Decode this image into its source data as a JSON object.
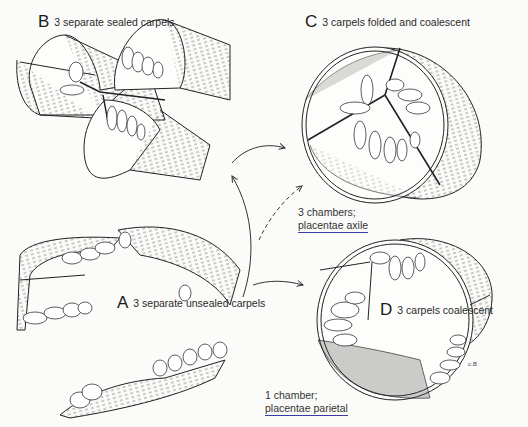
{
  "figure": {
    "panels": [
      {
        "id": "B",
        "letter": "B",
        "title": "3 separate sealed carpels"
      },
      {
        "id": "C",
        "letter": "C",
        "title": "3 carpels folded and coalescent"
      },
      {
        "id": "A",
        "letter": "A",
        "title": "3 separate unsealed carpels"
      },
      {
        "id": "D",
        "letter": "D",
        "title": "3 carpels coalescent"
      }
    ],
    "notes": {
      "C": {
        "line1": "3 chambers;",
        "line2": "placentae axile"
      },
      "D": {
        "line1": "1 chamber;",
        "line2": "placentae parietal"
      }
    },
    "signature": "c.B.",
    "arrows": [
      {
        "from": "A",
        "to": "B",
        "style": "solid"
      },
      {
        "from": "B",
        "to": "C",
        "style": "solid"
      },
      {
        "from": "A",
        "to": "C",
        "style": "dashed"
      },
      {
        "from": "A",
        "to": "D",
        "style": "solid"
      }
    ],
    "colors": {
      "ink": "#222222",
      "underline": "#3a3aa8",
      "background": "#fbfbf9"
    }
  }
}
